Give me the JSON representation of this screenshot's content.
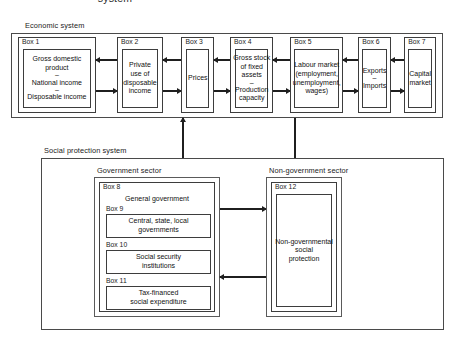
{
  "figure": {
    "title": "system"
  },
  "economic_system": {
    "label": "Economic system",
    "boxes": [
      {
        "id": "Box 1",
        "lines": [
          "Gross domestic",
          "product",
          "–",
          "National income",
          "–",
          "Disposable income"
        ]
      },
      {
        "id": "Box 2",
        "lines": [
          "Private",
          "use of",
          "disposable",
          "income"
        ]
      },
      {
        "id": "Box 3",
        "lines": [
          "Prices"
        ]
      },
      {
        "id": "Box 4",
        "lines": [
          "Gross stock",
          "of fixed",
          "assets",
          "–",
          "Production",
          "capacity"
        ]
      },
      {
        "id": "Box 5",
        "lines": [
          "Labour market",
          "(employment,",
          "unemployment,",
          "wages)"
        ]
      },
      {
        "id": "Box 6",
        "lines": [
          "Exports",
          "–",
          "Imports"
        ]
      },
      {
        "id": "Box 7",
        "lines": [
          "Capital",
          "market"
        ]
      }
    ]
  },
  "social_protection_system": {
    "label": "Social protection system",
    "government_sector": {
      "label": "Government sector",
      "box8": {
        "id": "Box 8",
        "title": "General government"
      },
      "box9": {
        "id": "Box 9",
        "lines": [
          "Central, state, local",
          "governments"
        ]
      },
      "box10": {
        "id": "Box 10",
        "lines": [
          "Social security",
          "institutions"
        ]
      },
      "box11": {
        "id": "Box 11",
        "lines": [
          "Tax-financed",
          "social expenditure"
        ]
      }
    },
    "non_government_sector": {
      "label": "Non-government sector",
      "box12": {
        "id": "Box 12",
        "lines": [
          "Non-governmental",
          "social",
          "protection"
        ]
      }
    }
  },
  "colors": {
    "line": "#3d3d3d",
    "frame": "#4a4a4a",
    "arrow": "#1f1f1f",
    "text": "#111111",
    "background": "#ffffff"
  }
}
